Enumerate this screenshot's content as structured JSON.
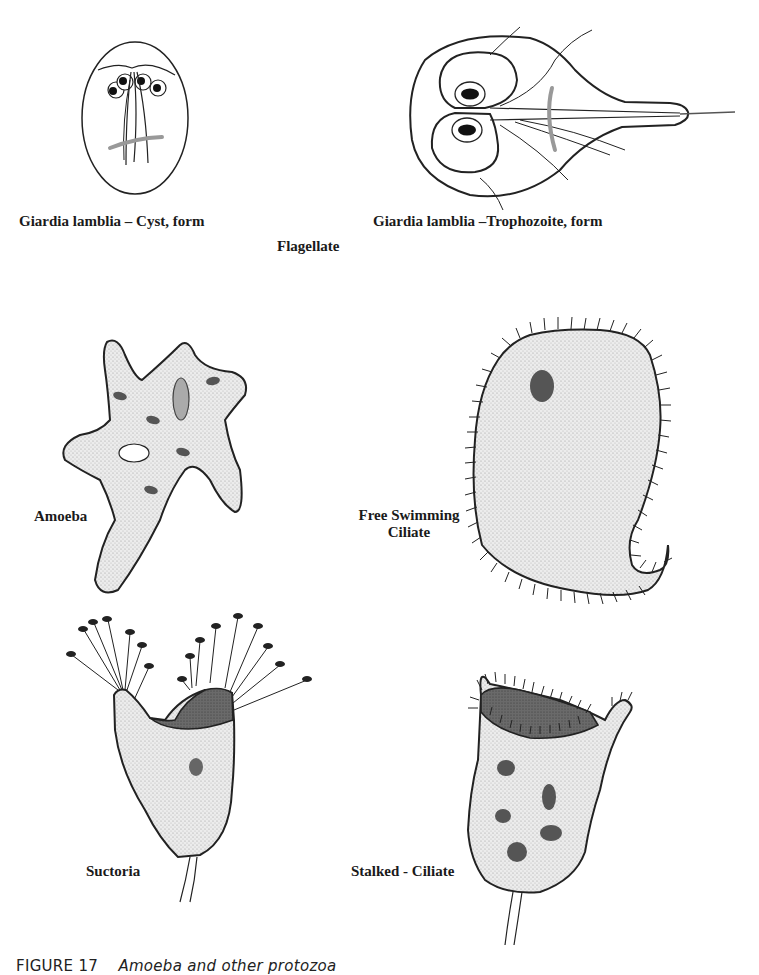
{
  "figure": {
    "title": "Protozoa",
    "group_label": "Flagellate",
    "organisms": [
      {
        "id": "giardia-cyst",
        "label": "Giardia lamblia – Cyst, form"
      },
      {
        "id": "giardia-trophozoite",
        "label": "Giardia lamblia –Trophozoite, form"
      },
      {
        "id": "amoeba",
        "label": "Amoeba"
      },
      {
        "id": "free-swimming-ciliate",
        "label_line1": "Free Swimming",
        "label_line2": "Ciliate"
      },
      {
        "id": "suctoria",
        "label": "Suctoria"
      },
      {
        "id": "stalked-ciliate",
        "label": "Stalked - Ciliate"
      }
    ],
    "caption": {
      "number": "FIGURE 17",
      "text": "Amoeba and other protozoa"
    },
    "colors": {
      "outline": "#1a1a1a",
      "cytoplasm_fill": "#e6e6e6",
      "dark_fill": "#6e6e6e",
      "nucleus_fill": "#555555",
      "median_body": "#9a9a9a"
    }
  }
}
